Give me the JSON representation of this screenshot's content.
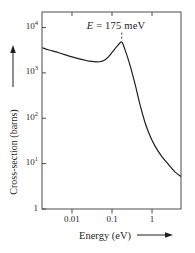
{
  "chart_data": {
    "type": "line",
    "title": "",
    "xlabel": "Energy (eV)",
    "ylabel": "Cross-section (barns)",
    "x_scale": "log",
    "y_scale": "log",
    "xlim": [
      0.00178,
      5.3
    ],
    "ylim": [
      1,
      22000
    ],
    "grid": false,
    "legend": "none",
    "x_ticks": [
      {
        "value": 0.01,
        "label": "0.01"
      },
      {
        "value": 0.1,
        "label": "0.1"
      },
      {
        "value": 1,
        "label": "1"
      }
    ],
    "y_ticks": [
      {
        "value": 1,
        "base": "1",
        "exp": ""
      },
      {
        "value": 10,
        "base": "10",
        "exp": "1"
      },
      {
        "value": 100,
        "base": "10",
        "exp": "2"
      },
      {
        "value": 1000,
        "base": "10",
        "exp": "3"
      },
      {
        "value": 10000,
        "base": "10",
        "exp": "4"
      }
    ],
    "series": [
      {
        "name": "neutron-capture-cross-section",
        "points": [
          [
            0.0018,
            3600
          ],
          [
            0.0025,
            3250
          ],
          [
            0.004,
            2900
          ],
          [
            0.006,
            2600
          ],
          [
            0.01,
            2250
          ],
          [
            0.016,
            2000
          ],
          [
            0.025,
            1850
          ],
          [
            0.04,
            1750
          ],
          [
            0.055,
            1800
          ],
          [
            0.07,
            2000
          ],
          [
            0.09,
            2500
          ],
          [
            0.11,
            3150
          ],
          [
            0.14,
            4050
          ],
          [
            0.175,
            4800
          ],
          [
            0.21,
            3300
          ],
          [
            0.28,
            1500
          ],
          [
            0.38,
            550
          ],
          [
            0.5,
            200
          ],
          [
            0.67,
            80
          ],
          [
            0.9,
            40
          ],
          [
            1.2,
            24
          ],
          [
            1.75,
            14.5
          ],
          [
            2.6,
            9.5
          ],
          [
            3.8,
            6.5
          ],
          [
            5.3,
            5.2
          ]
        ]
      }
    ],
    "annotation": {
      "text_italic": "E",
      "text_rest": " = 175 meV",
      "peak_energy_ev": 0.175,
      "dash_x": 0.175,
      "dash_sigma_top": 7700,
      "dash_sigma_bottom": 5100
    },
    "colors": {
      "curve": "#1f1f1f",
      "frame": "#4d4d4d",
      "text": "#1f1f1f",
      "background": "#ffffff"
    }
  }
}
